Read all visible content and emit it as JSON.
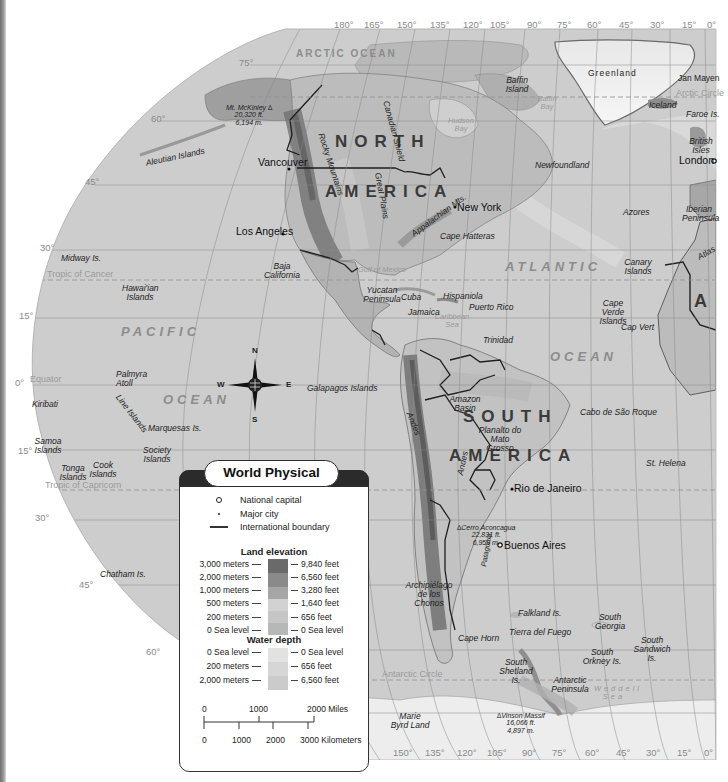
{
  "map": {
    "title": "World Physical",
    "graticule": {
      "top_longitudes": [
        "180°",
        "165°",
        "150°",
        "135°",
        "120°",
        "105°",
        "90°",
        "75°",
        "60°",
        "45°",
        "30°",
        "15°",
        "0°"
      ],
      "bottom_longitudes": [
        "150°",
        "135°",
        "120°",
        "105°",
        "90°",
        "75°",
        "60°",
        "45°",
        "30°",
        "15°",
        "0°"
      ],
      "latitudes": [
        "75°",
        "60°",
        "45°",
        "30°",
        "15°",
        "0°",
        "15°",
        "30°",
        "45°",
        "60°"
      ]
    },
    "lines": {
      "arctic_circle": "Arctic Circle",
      "tropic_of_cancer": "Tropic of Cancer",
      "equator": "Equator",
      "tropic_of_capricorn": "Tropic of Capricorn",
      "antarctic_circle": "Antarctic Circle"
    },
    "oceans": {
      "arctic": "ARCTIC OCEAN",
      "pacific_1": "PACIFIC",
      "pacific_2": "OCEAN",
      "atlantic_1": "ATLANTIC",
      "atlantic_2": "OCEAN"
    },
    "continents": {
      "na_1": "NORTH",
      "na_2": "AMERICA",
      "sa_1": "SOUTH",
      "sa_2": "AMERICA",
      "africa_partial": "A"
    },
    "water_bodies": {
      "baffin_bay": "Baffin Bay",
      "hudson_bay": "Hudson Bay",
      "gulf_of_mexico": "Gulf of Mexico",
      "caribbean_sea": "Caribbean Sea",
      "weddell_sea": "Weddell Sea"
    },
    "cities": {
      "vancouver": "Vancouver",
      "los_angeles": "Los Angeles",
      "new_york": "New York",
      "london": "London",
      "rio": "Rio de Janeiro",
      "buenos_aires": "Buenos Aires"
    },
    "features": {
      "mckinley": "Mt. McKinley ∆\n20,320 ft.\n6,194 m.",
      "aleutian": "Aleutian Islands",
      "rocky": "Rocky Mountains",
      "canadian_shield": "Canadian Shield",
      "great_plains": "Great Plains",
      "appalachian": "Appalachian Mts.",
      "baffin_island": "Baffin Island",
      "greenland": "Greenland",
      "jan_mayen": "Jan Mayen",
      "iceland": "Iceland",
      "faroe": "Faroe Is.",
      "british_isles": "British Isles",
      "newfoundland": "Newfoundland",
      "iberian": "Iberian Peninsula",
      "azores": "Azores",
      "atlas": "Atlas",
      "canary": "Canary Islands",
      "cape_hatteras": "Cape Hatteras",
      "midway": "Midway Is.",
      "hawaiian": "Hawai'ian Islands",
      "baja": "Baja California",
      "yucatan": "Yucatan Peninsula",
      "cuba": "Cuba",
      "hispaniola": "Hispaniola",
      "puerto_rico": "Puerto Rico",
      "jamaica": "Jamaica",
      "cape_verde": "Cape Verde Islands",
      "cap_vert": "Cap Vert",
      "trinidad": "Trinidad",
      "palmyra": "Palmyra Atoll",
      "galapagos": "Galapagos Islands",
      "kiribati": "Kiribati",
      "line_islands": "Line Islands",
      "marquesas": "Marquesas Is.",
      "amazon_basin": "Amazon Basin",
      "andes": "Andes",
      "planalto": "Planalto do Mato Grosso",
      "cabo_sao_roque": "Cabo de São Roque",
      "samoa": "Samoa Islands",
      "society": "Society Islands",
      "tonga": "Tonga Islands",
      "cook": "Cook Islands",
      "st_helena": "St. Helena",
      "aconcagua": "∆Cerro Aconcagua\n22,831 ft.\n6,959 m.",
      "chatham": "Chatham Is.",
      "chonos": "Archipiélago de los Chonos",
      "patagonia": "Patagonia",
      "falkland": "Falkland Is.",
      "south_georgia": "South Georgia",
      "south_sandwich": "South Sandwich Is.",
      "tierra_del_fuego": "Tierra del Fuego",
      "cape_horn": "Cape Horn",
      "south_orkney": "South Orkney Is.",
      "south_shetland": "South Shetland Is.",
      "antarctic_peninsula": "Antarctic Peninsula",
      "marie_byrd": "Marie Byrd Land",
      "vinson": "∆Vinson Massif\n16,066 ft.\n4,897 m."
    },
    "compass": {
      "n": "N",
      "s": "S",
      "e": "E",
      "w": "W"
    }
  },
  "legend": {
    "title": "World Physical",
    "symbols": [
      {
        "icon": "national-capital-icon",
        "label": "National capital"
      },
      {
        "icon": "major-city-icon",
        "label": "Major city"
      },
      {
        "icon": "international-boundary-icon",
        "label": "International boundary"
      }
    ],
    "land_elevation": {
      "heading": "Land elevation",
      "rows": [
        {
          "meters": "3,000 meters",
          "feet": "9,840 feet",
          "color": "#6a6a6a"
        },
        {
          "meters": "2,000 meters",
          "feet": "6,560 feet",
          "color": "#8a8a8a"
        },
        {
          "meters": "1,000 meters",
          "feet": "3,280 feet",
          "color": "#a6a6a6"
        },
        {
          "meters": "500 meters",
          "feet": "1,640 feet",
          "color": "#cfcfcf"
        },
        {
          "meters": "200 meters",
          "feet": "656 feet",
          "color": "#c4c4c4"
        },
        {
          "meters": "0 Sea level",
          "feet": "0 Sea level",
          "color": "#b7b7b7"
        }
      ]
    },
    "water_depth": {
      "heading": "Water depth",
      "rows": [
        {
          "meters": "0 Sea level",
          "feet": "0 Sea level",
          "color": "#e2e2e2"
        },
        {
          "meters": "200 meters",
          "feet": "656 feet",
          "color": "#d6d6d6"
        },
        {
          "meters": "2,000 meters",
          "feet": "6,560 feet",
          "color": "#cbcbcb"
        }
      ]
    },
    "scale": {
      "miles": [
        "0",
        "1000",
        "2000 Miles"
      ],
      "km": [
        "0",
        "1000",
        "2000",
        "3000 Kilometers"
      ]
    }
  }
}
